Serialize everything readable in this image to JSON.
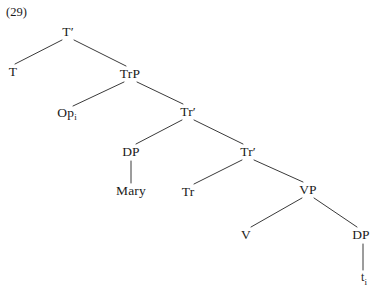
{
  "figure": {
    "example_number": "(29)",
    "line_color": "#3a3a3a",
    "text_color": "#1a1a1a",
    "background_color": "#ffffff"
  },
  "tree": {
    "nodes": [
      {
        "id": "tp",
        "label": "T",
        "prime": "′",
        "sub": "",
        "x": 68,
        "y": 32
      },
      {
        "id": "t",
        "label": "T",
        "prime": "",
        "sub": "",
        "x": 13,
        "y": 72
      },
      {
        "id": "trp",
        "label": "TrP",
        "prime": "",
        "sub": "",
        "x": 130,
        "y": 74
      },
      {
        "id": "op",
        "label": "Op",
        "prime": "",
        "sub": "i",
        "x": 67,
        "y": 114
      },
      {
        "id": "trbar1",
        "label": "Tr",
        "prime": "′",
        "sub": "",
        "x": 188,
        "y": 112
      },
      {
        "id": "dp1",
        "label": "DP",
        "prime": "",
        "sub": "",
        "x": 131,
        "y": 152
      },
      {
        "id": "trbar2",
        "label": "Tr",
        "prime": "′",
        "sub": "",
        "x": 248,
        "y": 152
      },
      {
        "id": "mary",
        "label": "Mary",
        "prime": "",
        "sub": "",
        "x": 131,
        "y": 191
      },
      {
        "id": "tr",
        "label": "Tr",
        "prime": "",
        "sub": "",
        "x": 188,
        "y": 192
      },
      {
        "id": "vp",
        "label": "VP",
        "prime": "",
        "sub": "",
        "x": 308,
        "y": 190
      },
      {
        "id": "v",
        "label": "V",
        "prime": "",
        "sub": "",
        "x": 246,
        "y": 235
      },
      {
        "id": "dp2",
        "label": "DP",
        "prime": "",
        "sub": "",
        "x": 361,
        "y": 235
      },
      {
        "id": "trace",
        "label": "t",
        "prime": "",
        "sub": "i",
        "x": 364,
        "y": 279
      }
    ],
    "edges": [
      {
        "from": "tp",
        "to": "t",
        "x1": 62,
        "y1": 40,
        "x2": 15,
        "y2": 64
      },
      {
        "from": "tp",
        "to": "trp",
        "x1": 74,
        "y1": 40,
        "x2": 126,
        "y2": 66
      },
      {
        "from": "trp",
        "to": "op",
        "x1": 124,
        "y1": 82,
        "x2": 73,
        "y2": 106
      },
      {
        "from": "trp",
        "to": "trbar1",
        "x1": 137,
        "y1": 82,
        "x2": 183,
        "y2": 104
      },
      {
        "from": "trbar1",
        "to": "dp1",
        "x1": 182,
        "y1": 120,
        "x2": 136,
        "y2": 144
      },
      {
        "from": "trbar1",
        "to": "trbar2",
        "x1": 194,
        "y1": 120,
        "x2": 243,
        "y2": 144
      },
      {
        "from": "dp1",
        "to": "mary",
        "x1": 131,
        "y1": 161,
        "x2": 131,
        "y2": 183
      },
      {
        "from": "trbar2",
        "to": "tr",
        "x1": 242,
        "y1": 160,
        "x2": 194,
        "y2": 184
      },
      {
        "from": "trbar2",
        "to": "vp",
        "x1": 254,
        "y1": 160,
        "x2": 303,
        "y2": 182
      },
      {
        "from": "vp",
        "to": "v",
        "x1": 302,
        "y1": 198,
        "x2": 251,
        "y2": 227
      },
      {
        "from": "vp",
        "to": "dp2",
        "x1": 314,
        "y1": 198,
        "x2": 357,
        "y2": 227
      },
      {
        "from": "dp2",
        "to": "trace",
        "x1": 363,
        "y1": 244,
        "x2": 363,
        "y2": 270
      }
    ]
  }
}
